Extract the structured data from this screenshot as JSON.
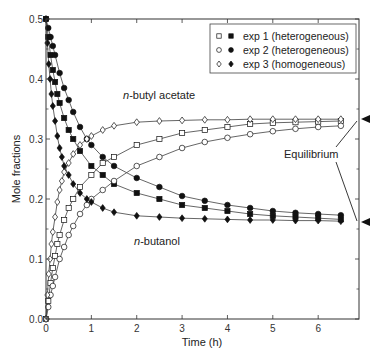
{
  "chart_data": {
    "type": "scatter",
    "title": "",
    "xlabel": "Time (h)",
    "ylabel": "Mole fractions",
    "xlim": [
      0,
      6.9
    ],
    "ylim": [
      0.0,
      0.5
    ],
    "xticks": [
      0,
      1,
      2,
      3,
      4,
      5,
      6
    ],
    "yticks": [
      0.0,
      0.1,
      0.2,
      0.3,
      0.4,
      0.5
    ],
    "ytick_labels": [
      "0.0",
      "0.1",
      "0.2",
      "0.3",
      "0.4",
      "0.5"
    ],
    "grid": false,
    "legend_position": "upper right",
    "legend": [
      {
        "label": "exp 1 (heterogeneous)",
        "markers": [
          "open-square",
          "filled-square"
        ]
      },
      {
        "label": "exp 2 (heterogeneous)",
        "markers": [
          "open-circle",
          "filled-circle"
        ]
      },
      {
        "label": "exp 3 (homogeneous)",
        "markers": [
          "open-diamond",
          "filled-diamond"
        ]
      }
    ],
    "annotations": [
      {
        "text": "n-butyl acetate",
        "italic_prefix": "n",
        "x": 1.3,
        "y": 0.375
      },
      {
        "text": "n-butanol",
        "italic_prefix": "n",
        "x": 1.35,
        "y": 0.155
      },
      {
        "text": "Equilibrium",
        "x": 5.35,
        "y": 0.255,
        "arrows_to": [
          0.335,
          0.162
        ]
      }
    ],
    "equilibrium_markers": [
      0.335,
      0.162
    ],
    "series": [
      {
        "name": "exp 1 n-butyl acetate",
        "marker": "open-square",
        "x": [
          0.0,
          0.05,
          0.1,
          0.15,
          0.2,
          0.25,
          0.3,
          0.4,
          0.5,
          0.6,
          0.75,
          1.0,
          1.25,
          1.5,
          2.0,
          2.5,
          3.0,
          3.5,
          4.0,
          4.5,
          5.0,
          5.5,
          6.0,
          6.5
        ],
        "y": [
          0.0,
          0.03,
          0.06,
          0.085,
          0.105,
          0.125,
          0.14,
          0.165,
          0.185,
          0.2,
          0.22,
          0.24,
          0.26,
          0.27,
          0.29,
          0.3,
          0.31,
          0.315,
          0.32,
          0.325,
          0.327,
          0.328,
          0.329,
          0.33
        ]
      },
      {
        "name": "exp 1 n-butanol",
        "marker": "filled-square",
        "x": [
          0.0,
          0.05,
          0.1,
          0.15,
          0.2,
          0.25,
          0.3,
          0.4,
          0.5,
          0.6,
          0.75,
          1.0,
          1.25,
          1.5,
          2.0,
          2.5,
          3.0,
          3.5,
          4.0,
          4.5,
          5.0,
          5.5,
          6.0,
          6.5
        ],
        "y": [
          0.5,
          0.47,
          0.44,
          0.415,
          0.395,
          0.375,
          0.36,
          0.335,
          0.315,
          0.3,
          0.28,
          0.255,
          0.24,
          0.225,
          0.21,
          0.2,
          0.19,
          0.185,
          0.18,
          0.175,
          0.172,
          0.17,
          0.168,
          0.166
        ]
      },
      {
        "name": "exp 2 n-butyl acetate",
        "marker": "open-circle",
        "x": [
          0.0,
          0.05,
          0.1,
          0.15,
          0.2,
          0.3,
          0.4,
          0.5,
          0.6,
          0.75,
          0.9,
          1.0,
          1.25,
          1.5,
          2.0,
          2.5,
          3.0,
          3.5,
          4.0,
          4.5,
          5.0,
          5.5,
          6.0,
          6.5
        ],
        "y": [
          0.0,
          0.02,
          0.04,
          0.055,
          0.07,
          0.1,
          0.12,
          0.14,
          0.155,
          0.175,
          0.19,
          0.2,
          0.215,
          0.23,
          0.255,
          0.27,
          0.285,
          0.295,
          0.302,
          0.308,
          0.313,
          0.317,
          0.32,
          0.322
        ]
      },
      {
        "name": "exp 2 n-butanol",
        "marker": "filled-circle",
        "x": [
          0.0,
          0.05,
          0.1,
          0.15,
          0.2,
          0.3,
          0.4,
          0.5,
          0.6,
          0.75,
          0.9,
          1.0,
          1.25,
          1.5,
          2.0,
          2.5,
          3.0,
          3.5,
          4.0,
          4.5,
          5.0,
          5.5,
          6.0,
          6.5
        ],
        "y": [
          0.5,
          0.485,
          0.47,
          0.455,
          0.44,
          0.41,
          0.385,
          0.365,
          0.345,
          0.32,
          0.3,
          0.29,
          0.27,
          0.255,
          0.235,
          0.22,
          0.205,
          0.197,
          0.19,
          0.185,
          0.18,
          0.177,
          0.175,
          0.173
        ]
      },
      {
        "name": "exp 3 n-butyl acetate",
        "marker": "open-diamond",
        "x": [
          0.0,
          0.03,
          0.06,
          0.09,
          0.12,
          0.15,
          0.2,
          0.25,
          0.3,
          0.35,
          0.4,
          0.5,
          0.6,
          0.75,
          0.9,
          1.0,
          1.25,
          1.5,
          2.0,
          2.5,
          3.0,
          3.5,
          4.0,
          4.5,
          5.0,
          5.5,
          6.0,
          6.5
        ],
        "y": [
          0.0,
          0.04,
          0.075,
          0.1,
          0.125,
          0.145,
          0.17,
          0.195,
          0.215,
          0.23,
          0.245,
          0.26,
          0.275,
          0.29,
          0.3,
          0.305,
          0.315,
          0.322,
          0.328,
          0.33,
          0.331,
          0.332,
          0.332,
          0.333,
          0.333,
          0.333,
          0.333,
          0.333
        ]
      },
      {
        "name": "exp 3 n-butanol",
        "marker": "filled-diamond",
        "x": [
          0.0,
          0.03,
          0.06,
          0.09,
          0.12,
          0.15,
          0.2,
          0.25,
          0.3,
          0.35,
          0.4,
          0.5,
          0.6,
          0.75,
          0.9,
          1.0,
          1.25,
          1.5,
          2.0,
          2.5,
          3.0,
          3.5,
          4.0,
          4.5,
          5.0,
          5.5,
          6.0,
          6.5
        ],
        "y": [
          0.5,
          0.46,
          0.425,
          0.4,
          0.375,
          0.355,
          0.33,
          0.305,
          0.285,
          0.27,
          0.255,
          0.24,
          0.225,
          0.21,
          0.2,
          0.195,
          0.185,
          0.178,
          0.172,
          0.17,
          0.168,
          0.167,
          0.166,
          0.165,
          0.165,
          0.164,
          0.164,
          0.163
        ]
      }
    ]
  },
  "colors": {
    "axis": "#333333",
    "series": "#111111",
    "curve": "#555555",
    "background": "#ffffff"
  }
}
